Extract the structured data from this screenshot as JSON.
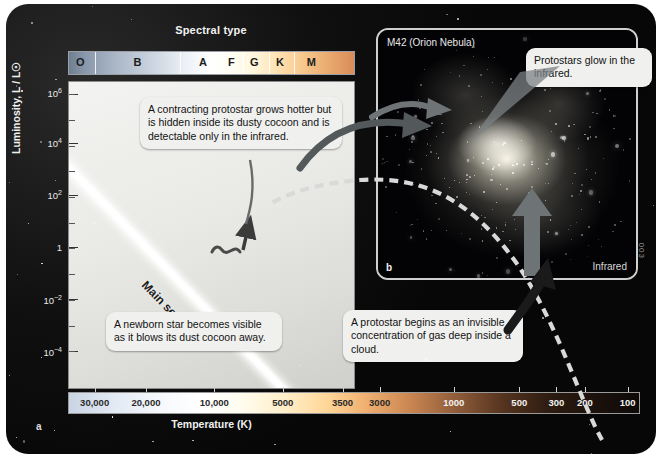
{
  "figure": {
    "panel_a_label": "a",
    "panel_b_label": "b",
    "credit": "003"
  },
  "spectral": {
    "title": "Spectral type",
    "classes": [
      {
        "label": "O",
        "pos": 4
      },
      {
        "label": "B",
        "pos": 24
      },
      {
        "label": "A",
        "pos": 47
      },
      {
        "label": "F",
        "pos": 57
      },
      {
        "label": "G",
        "pos": 65
      },
      {
        "label": "K",
        "pos": 74
      },
      {
        "label": "M",
        "pos": 85
      }
    ],
    "dividers": [
      9,
      39,
      53,
      61,
      70,
      79
    ]
  },
  "axes": {
    "ylabel": "Luminosity, L / L☉",
    "xlabel": "Temperature (K)",
    "yticks": [
      {
        "label": "10",
        "exp": "6",
        "pos": 4
      },
      {
        "label": "10",
        "exp": "4",
        "pos": 20
      },
      {
        "label": "10",
        "exp": "2",
        "pos": 37
      },
      {
        "label": "1",
        "exp": "",
        "pos": 54
      },
      {
        "label": "10",
        "exp": "−2",
        "pos": 71
      },
      {
        "label": "10",
        "exp": "−4",
        "pos": 88
      }
    ],
    "xticks": [
      {
        "label": "30,000",
        "pos": 4.5,
        "dark": false
      },
      {
        "label": "20,000",
        "pos": 13.5,
        "dark": false
      },
      {
        "label": "10,000",
        "pos": 25.5,
        "dark": false
      },
      {
        "label": "5000",
        "pos": 37.5,
        "dark": false
      },
      {
        "label": "3500",
        "pos": 48.0,
        "dark": false
      },
      {
        "label": "3000",
        "pos": 54.5,
        "dark": false
      },
      {
        "label": "1000",
        "pos": 67.5,
        "dark": true
      },
      {
        "label": "500",
        "pos": 79.0,
        "dark": true
      },
      {
        "label": "300",
        "pos": 85.5,
        "dark": true
      },
      {
        "label": "200",
        "pos": 90.5,
        "dark": true
      },
      {
        "label": "100",
        "pos": 98.0,
        "dark": true
      }
    ]
  },
  "track": {
    "main_sequence_label": "Main sequence"
  },
  "callouts": {
    "contracting": "A contracting protostar grows hotter but is hidden inside its dusty cocoon and is detectable only in the infrared.",
    "newborn": "A newborn star becomes visible as it blows its dust cocoon away.",
    "begins": "A protostar begins as an invisible concentration of gas deep inside a cloud.",
    "glow": "Protostars glow in the infrared."
  },
  "inset": {
    "title": "M42 (Orion Nebula)",
    "band": "Infrared"
  },
  "colors": {
    "panel_bg": "#080808",
    "plot_bg": "#e9e9e6",
    "callout_bg": "#f0f0ee",
    "main_sequence": "#ffffff",
    "track_dash": "#e6e6e6",
    "arrow_gray": "#6e7376"
  }
}
